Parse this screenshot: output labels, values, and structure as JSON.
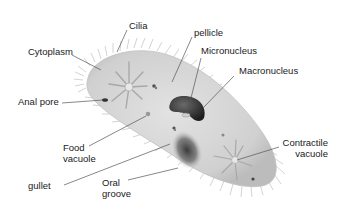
{
  "diagram": {
    "labels": {
      "cilia": "Cilia",
      "cytoplasm": "Cytoplasm",
      "anal_pore": "Anal pore",
      "food_vacuole_1": "Food",
      "food_vacuole_2": "vacuole",
      "gullet": "gullet",
      "oral_groove_1": "Oral",
      "oral_groove_2": "groove",
      "pellicle": "pellicle",
      "micronucleus": "Micronucleus",
      "macronucleus": "Macronucleus",
      "contractile_vacuole_1": "Contractile",
      "contractile_vacuole_2": "vacuole"
    },
    "colors": {
      "body": "#d6d6d6",
      "body_edge": "#bdbdbd",
      "cilia": "#b0b0b0",
      "macronucleus": "#2a2a2a",
      "oral_groove": "#4a4a4a",
      "leader_line": "#555555",
      "text": "#1a1a1a"
    }
  }
}
